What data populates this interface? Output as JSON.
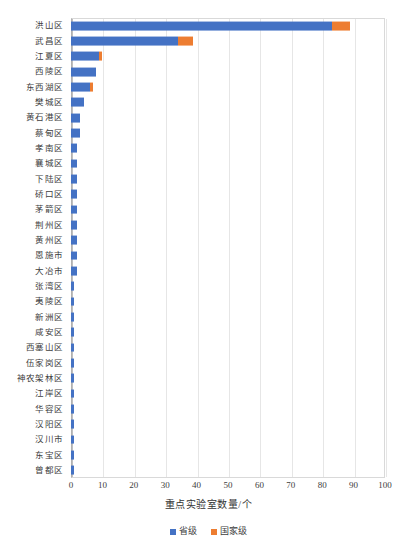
{
  "chart_data": {
    "type": "bar",
    "orientation": "horizontal",
    "stacked": true,
    "title": "",
    "xlabel": "重点实验室数量/个",
    "ylabel": "",
    "xlim": [
      0,
      100
    ],
    "xticks": [
      0,
      10,
      20,
      30,
      40,
      50,
      60,
      70,
      80,
      90,
      100
    ],
    "grid": true,
    "grid_axis": "x",
    "legend_position": "bottom",
    "categories": [
      "洪山区",
      "武昌区",
      "江夏区",
      "西陵区",
      "东西湖区",
      "樊城区",
      "黄石港区",
      "蔡甸区",
      "孝南区",
      "襄城区",
      "下陆区",
      "硚口区",
      "茅箭区",
      "荆州区",
      "黄州区",
      "恩施市",
      "大冶市",
      "张湾区",
      "夷陵区",
      "新洲区",
      "咸安区",
      "西塞山区",
      "伍家岗区",
      "神农架林区",
      "江岸区",
      "华容区",
      "汉阳区",
      "汉川市",
      "东宝区",
      "曾都区"
    ],
    "series": [
      {
        "name": "省级",
        "color": "#4472c4",
        "values": [
          83,
          34,
          9,
          8,
          6,
          4,
          3,
          3,
          2,
          2,
          2,
          2,
          2,
          2,
          2,
          2,
          2,
          1,
          1,
          1,
          1,
          1,
          1,
          1,
          1,
          1,
          1,
          1,
          1,
          1
        ]
      },
      {
        "name": "国家级",
        "color": "#ed7d31",
        "values": [
          6,
          5,
          1,
          0,
          1,
          0,
          0,
          0,
          0,
          0,
          0,
          0,
          0,
          0,
          0,
          0,
          0,
          0,
          0,
          0,
          0,
          0,
          0,
          0,
          0,
          0,
          0,
          0,
          0,
          0
        ]
      }
    ],
    "totals": [
      89,
      39,
      10,
      8,
      7,
      4,
      3,
      3,
      2,
      2,
      2,
      2,
      2,
      2,
      2,
      2,
      2,
      1,
      1,
      1,
      1,
      1,
      1,
      1,
      1,
      1,
      1,
      1,
      1,
      1
    ]
  },
  "legend": {
    "items": [
      {
        "label": "省级",
        "color": "#4472c4"
      },
      {
        "label": "国家级",
        "color": "#ed7d31"
      }
    ]
  },
  "axis": {
    "x_title": "重点实验室数量/个"
  }
}
